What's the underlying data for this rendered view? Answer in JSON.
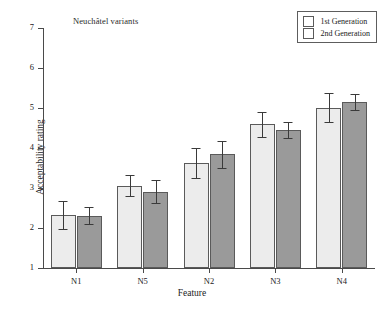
{
  "chart_data": {
    "type": "bar",
    "title": "Neuchâtel variants",
    "xlabel": "Feature",
    "ylabel": "Acceptability rating",
    "categories": [
      "N1",
      "N5",
      "N2",
      "N3",
      "N4"
    ],
    "ylim": [
      1,
      7
    ],
    "yticks": [
      1,
      2,
      3,
      4,
      5,
      6,
      7
    ],
    "grid": false,
    "legend_position": "top-right",
    "series": [
      {
        "name": "1st Generation",
        "color": "#ececec",
        "values": [
          2.32,
          3.06,
          3.62,
          4.59,
          5.01
        ],
        "errors": [
          0.35,
          0.26,
          0.37,
          0.31,
          0.37
        ]
      },
      {
        "name": "2nd Generation",
        "color": "#9a9a9a",
        "values": [
          2.31,
          2.91,
          3.84,
          4.45,
          5.15
        ],
        "errors": [
          0.22,
          0.28,
          0.33,
          0.19,
          0.21
        ]
      }
    ]
  }
}
